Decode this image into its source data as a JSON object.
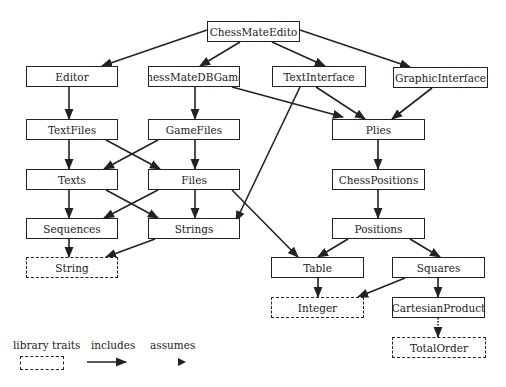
{
  "diagram": {
    "nodes": [
      {
        "id": "chessmateeditor",
        "label": "ChessMateEdito",
        "x": 207,
        "y": 21,
        "w": 93,
        "h": 21,
        "style": "solid"
      },
      {
        "id": "editor",
        "label": "Editor",
        "x": 26,
        "y": 66,
        "w": 92,
        "h": 21,
        "style": "solid"
      },
      {
        "id": "chessmatedbgames",
        "label": "ChessMateDBGames",
        "x": 148,
        "y": 66,
        "w": 92,
        "h": 21,
        "style": "solid"
      },
      {
        "id": "textinterface",
        "label": "TextInterface",
        "x": 272,
        "y": 66,
        "w": 94,
        "h": 21,
        "style": "solid"
      },
      {
        "id": "graphicinterface",
        "label": "GraphicInterface",
        "x": 393,
        "y": 67,
        "w": 95,
        "h": 21,
        "style": "solid"
      },
      {
        "id": "textfiles",
        "label": "TextFiles",
        "x": 26,
        "y": 119,
        "w": 92,
        "h": 21,
        "style": "solid"
      },
      {
        "id": "gamefiles",
        "label": "GameFiles",
        "x": 148,
        "y": 119,
        "w": 92,
        "h": 21,
        "style": "solid"
      },
      {
        "id": "plies",
        "label": "Plies",
        "x": 332,
        "y": 119,
        "w": 93,
        "h": 21,
        "style": "solid"
      },
      {
        "id": "texts",
        "label": "Texts",
        "x": 26,
        "y": 169,
        "w": 92,
        "h": 21,
        "style": "solid"
      },
      {
        "id": "files",
        "label": "Files",
        "x": 148,
        "y": 169,
        "w": 92,
        "h": 21,
        "style": "solid"
      },
      {
        "id": "chesspositions",
        "label": "ChessPositions",
        "x": 332,
        "y": 169,
        "w": 93,
        "h": 21,
        "style": "solid"
      },
      {
        "id": "sequences",
        "label": "Sequences",
        "x": 26,
        "y": 218,
        "w": 92,
        "h": 21,
        "style": "solid"
      },
      {
        "id": "strings",
        "label": "Strings",
        "x": 148,
        "y": 218,
        "w": 92,
        "h": 21,
        "style": "solid"
      },
      {
        "id": "positions",
        "label": "Positions",
        "x": 332,
        "y": 218,
        "w": 93,
        "h": 21,
        "style": "solid"
      },
      {
        "id": "string",
        "label": "String",
        "x": 26,
        "y": 257,
        "w": 92,
        "h": 21,
        "style": "dashed"
      },
      {
        "id": "table",
        "label": "Table",
        "x": 271,
        "y": 257,
        "w": 93,
        "h": 21,
        "style": "solid"
      },
      {
        "id": "squares",
        "label": "Squares",
        "x": 392,
        "y": 257,
        "w": 93,
        "h": 21,
        "style": "solid"
      },
      {
        "id": "integer",
        "label": "Integer",
        "x": 271,
        "y": 297,
        "w": 93,
        "h": 21,
        "style": "dashed"
      },
      {
        "id": "cartesianproduct",
        "label": "CartesianProduct",
        "x": 392,
        "y": 297,
        "w": 93,
        "h": 21,
        "style": "solid"
      },
      {
        "id": "totalorder",
        "label": "TotalOrder",
        "x": 392,
        "y": 337,
        "w": 94,
        "h": 21,
        "style": "dashed"
      }
    ],
    "edges": [
      {
        "from": "chessmateeditor",
        "to": "editor",
        "type": "includes",
        "x1": 207,
        "y1": 30,
        "x2": 102,
        "y2": 66
      },
      {
        "from": "chessmateeditor",
        "to": "chessmatedbgames",
        "type": "includes",
        "x1": 240,
        "y1": 42,
        "x2": 200,
        "y2": 66
      },
      {
        "from": "chessmateeditor",
        "to": "textinterface",
        "type": "includes",
        "x1": 272,
        "y1": 42,
        "x2": 325,
        "y2": 66
      },
      {
        "from": "chessmateeditor",
        "to": "graphicinterface",
        "type": "includes",
        "x1": 300,
        "y1": 30,
        "x2": 410,
        "y2": 67
      },
      {
        "from": "editor",
        "to": "textfiles",
        "type": "includes",
        "x1": 69,
        "y1": 87,
        "x2": 69,
        "y2": 119
      },
      {
        "from": "chessmatedbgames",
        "to": "gamefiles",
        "type": "includes",
        "x1": 195,
        "y1": 87,
        "x2": 195,
        "y2": 119
      },
      {
        "from": "chessmatedbgames",
        "to": "plies",
        "type": "includes",
        "x1": 232,
        "y1": 87,
        "x2": 343,
        "y2": 117
      },
      {
        "from": "textinterface",
        "to": "plies",
        "type": "includes",
        "x1": 316,
        "y1": 87,
        "x2": 365,
        "y2": 119
      },
      {
        "from": "textinterface",
        "to": "strings",
        "type": "includes",
        "x1": 300,
        "y1": 87,
        "x2": 236,
        "y2": 221
      },
      {
        "from": "graphicinterface",
        "to": "plies",
        "type": "includes",
        "x1": 432,
        "y1": 88,
        "x2": 392,
        "y2": 119
      },
      {
        "from": "textfiles",
        "to": "texts",
        "type": "includes",
        "x1": 69,
        "y1": 140,
        "x2": 69,
        "y2": 169
      },
      {
        "from": "textfiles",
        "to": "files",
        "type": "includes",
        "x1": 106,
        "y1": 140,
        "x2": 160,
        "y2": 169
      },
      {
        "from": "gamefiles",
        "to": "texts",
        "type": "includes",
        "x1": 158,
        "y1": 140,
        "x2": 104,
        "y2": 169
      },
      {
        "from": "gamefiles",
        "to": "files",
        "type": "includes",
        "x1": 195,
        "y1": 140,
        "x2": 195,
        "y2": 169
      },
      {
        "from": "plies",
        "to": "chesspositions",
        "type": "includes",
        "x1": 378,
        "y1": 140,
        "x2": 378,
        "y2": 169
      },
      {
        "from": "texts",
        "to": "sequences",
        "type": "includes",
        "x1": 69,
        "y1": 190,
        "x2": 69,
        "y2": 218
      },
      {
        "from": "texts",
        "to": "strings",
        "type": "includes",
        "x1": 106,
        "y1": 190,
        "x2": 158,
        "y2": 218
      },
      {
        "from": "files",
        "to": "sequences",
        "type": "includes",
        "x1": 158,
        "y1": 190,
        "x2": 104,
        "y2": 218
      },
      {
        "from": "files",
        "to": "strings",
        "type": "includes",
        "x1": 195,
        "y1": 190,
        "x2": 195,
        "y2": 218
      },
      {
        "from": "files",
        "to": "table",
        "type": "includes",
        "x1": 232,
        "y1": 190,
        "x2": 298,
        "y2": 257
      },
      {
        "from": "chesspositions",
        "to": "positions",
        "type": "includes",
        "x1": 378,
        "y1": 190,
        "x2": 378,
        "y2": 218
      },
      {
        "from": "sequences",
        "to": "string",
        "type": "includes",
        "x1": 69,
        "y1": 239,
        "x2": 69,
        "y2": 257
      },
      {
        "from": "strings",
        "to": "string",
        "type": "includes",
        "x1": 155,
        "y1": 239,
        "x2": 106,
        "y2": 257
      },
      {
        "from": "positions",
        "to": "table",
        "type": "includes",
        "x1": 348,
        "y1": 239,
        "x2": 318,
        "y2": 257
      },
      {
        "from": "positions",
        "to": "squares",
        "type": "includes",
        "x1": 410,
        "y1": 239,
        "x2": 440,
        "y2": 257
      },
      {
        "from": "table",
        "to": "integer",
        "type": "includes",
        "x1": 318,
        "y1": 278,
        "x2": 318,
        "y2": 297
      },
      {
        "from": "squares",
        "to": "integer",
        "type": "includes",
        "x1": 405,
        "y1": 278,
        "x2": 358,
        "y2": 297
      },
      {
        "from": "squares",
        "to": "cartesianproduct",
        "type": "includes",
        "x1": 438,
        "y1": 278,
        "x2": 438,
        "y2": 297
      },
      {
        "from": "cartesianproduct",
        "to": "totalorder",
        "type": "assumes",
        "x1": 438,
        "y1": 318,
        "x2": 438,
        "y2": 337
      }
    ]
  },
  "legend": {
    "library_traits_label": "library traits",
    "includes_label": "includes",
    "assumes_label": "assumes"
  },
  "colors": {
    "stroke": "#222222",
    "background": "#ffffff"
  }
}
